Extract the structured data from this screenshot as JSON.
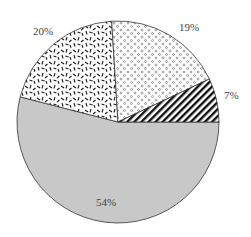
{
  "chart_data": {
    "type": "pie",
    "title": "",
    "start_angle_deg": 0,
    "direction": "clockwise",
    "slices": [
      {
        "label": "54%",
        "value": 54,
        "fill": "solid",
        "color": "#c8c8c8"
      },
      {
        "label": "20%",
        "value": 20,
        "fill": "dash-pattern",
        "color": "#1a1a1a"
      },
      {
        "label": "19%",
        "value": 19,
        "fill": "dot-pattern",
        "color": "#555555"
      },
      {
        "label": "7%",
        "value": 7,
        "fill": "diagonal-hatch",
        "color": "#111111"
      }
    ],
    "legend": "none"
  }
}
